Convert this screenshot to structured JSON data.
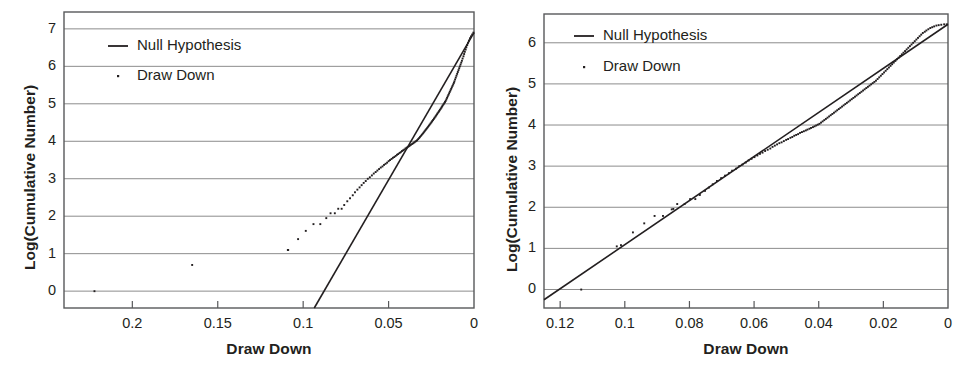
{
  "figure": {
    "panel_count": 2,
    "background": "#ffffff",
    "axis_color": "#58595b",
    "grid_color": "#8c8c8c",
    "series_color": "#231f20",
    "marker_color": "#231f20"
  },
  "chart_data": [
    {
      "id": "left",
      "type": "line",
      "title": "",
      "xlabel": "Draw Down",
      "ylabel": "Log(Cumulative Number)",
      "xlim": [
        0.24,
        0.0
      ],
      "ylim": [
        -0.45,
        7.45
      ],
      "x_reversed": true,
      "grid": true,
      "grid_axis": "y",
      "legend_position": "top-left",
      "xticks": [
        0.2,
        0.15,
        0.1,
        0.05,
        0
      ],
      "xtick_labels": [
        "0.2",
        "0.15",
        "0.1",
        "0.05",
        "0"
      ],
      "yticks": [
        0,
        1,
        2,
        3,
        4,
        5,
        6,
        7
      ],
      "ytick_labels": [
        "0",
        "1",
        "2",
        "3",
        "4",
        "5",
        "6",
        "7"
      ],
      "series": [
        {
          "name": "Null Hypothesis",
          "style": "line",
          "x": [
            0.0935,
            0.0
          ],
          "values": [
            -0.45,
            6.9
          ]
        },
        {
          "name": "Draw Down",
          "style": "scatter",
          "x": [
            0.2222,
            0.165,
            0.109,
            0.1088,
            0.103,
            0.0985,
            0.094,
            0.09,
            0.0865,
            0.084,
            0.0815,
            0.0795,
            0.0775,
            0.076,
            0.0742,
            0.0726,
            0.071,
            0.0697,
            0.0683,
            0.067,
            0.0658,
            0.0646,
            0.0634,
            0.0622,
            0.061,
            0.0598,
            0.0587,
            0.0576,
            0.0566,
            0.0556,
            0.0546,
            0.0536,
            0.0527,
            0.0518,
            0.0509,
            0.05,
            0.0492,
            0.0483,
            0.0475,
            0.0467,
            0.0459,
            0.0451,
            0.0444,
            0.0436,
            0.0429,
            0.0422,
            0.0415,
            0.0408,
            0.0401,
            0.0394,
            0.0388,
            0.0381,
            0.0375,
            0.0369,
            0.0362,
            0.0356,
            0.035,
            0.0344,
            0.0338,
            0.0333,
            0.0327,
            0.0321,
            0.0316,
            0.031,
            0.0305,
            0.0299,
            0.0294,
            0.0289,
            0.0284,
            0.0279,
            0.0274,
            0.0269,
            0.0264,
            0.0259,
            0.0254,
            0.0249,
            0.0245,
            0.024,
            0.0235,
            0.0231,
            0.0226,
            0.0222,
            0.0217,
            0.0213,
            0.0208,
            0.0204,
            0.02,
            0.0195,
            0.0191,
            0.0187,
            0.0183,
            0.0178,
            0.0174,
            0.017,
            0.0166,
            0.0162,
            0.0158,
            0.0154,
            0.015,
            0.0146,
            0.0142,
            0.0138,
            0.0134,
            0.013,
            0.0126,
            0.0122,
            0.0118,
            0.0115,
            0.0111,
            0.0107,
            0.0103,
            0.0099,
            0.0095,
            0.0091,
            0.0087,
            0.0083,
            0.0079,
            0.0075,
            0.0071,
            0.0067,
            0.0062,
            0.0058,
            0.0054,
            0.0049,
            0.0045,
            0.004,
            0.0035,
            0.003,
            0.0024,
            0.0018,
            0.0011,
            0.0004
          ],
          "values": [
            0.0,
            0.7,
            1.1,
            1.1,
            1.39,
            1.61,
            1.79,
            1.79,
            1.95,
            2.08,
            2.08,
            2.2,
            2.2,
            2.3,
            2.4,
            2.48,
            2.56,
            2.64,
            2.71,
            2.77,
            2.83,
            2.89,
            2.94,
            3.0,
            3.04,
            3.09,
            3.14,
            3.18,
            3.22,
            3.26,
            3.3,
            3.33,
            3.37,
            3.4,
            3.43,
            3.47,
            3.5,
            3.53,
            3.56,
            3.58,
            3.61,
            3.64,
            3.66,
            3.69,
            3.71,
            3.74,
            3.76,
            3.78,
            3.81,
            3.83,
            3.85,
            3.87,
            3.89,
            3.91,
            3.93,
            3.95,
            3.97,
            3.99,
            4.01,
            4.03,
            4.06,
            4.09,
            4.12,
            4.15,
            4.18,
            4.21,
            4.24,
            4.27,
            4.3,
            4.33,
            4.36,
            4.39,
            4.42,
            4.45,
            4.48,
            4.51,
            4.54,
            4.57,
            4.6,
            4.63,
            4.66,
            4.69,
            4.72,
            4.75,
            4.78,
            4.81,
            4.84,
            4.87,
            4.9,
            4.93,
            4.96,
            4.99,
            5.02,
            5.05,
            5.08,
            5.12,
            5.16,
            5.2,
            5.24,
            5.28,
            5.32,
            5.36,
            5.4,
            5.44,
            5.48,
            5.52,
            5.56,
            5.6,
            5.65,
            5.7,
            5.75,
            5.8,
            5.85,
            5.9,
            5.95,
            6.0,
            6.05,
            6.1,
            6.15,
            6.21,
            6.27,
            6.33,
            6.39,
            6.45,
            6.51,
            6.57,
            6.63,
            6.69,
            6.75,
            6.8,
            6.85,
            6.9
          ]
        }
      ]
    },
    {
      "id": "right",
      "type": "line",
      "title": "",
      "xlabel": "Draw Down",
      "ylabel": "Log(Cumulative Number)",
      "xlim": [
        0.125,
        0.0
      ],
      "ylim": [
        -0.45,
        6.7
      ],
      "x_reversed": true,
      "grid": true,
      "grid_axis": "y",
      "legend_position": "top-left",
      "xticks": [
        0.12,
        0.1,
        0.08,
        0.06,
        0.04,
        0.02,
        0
      ],
      "xtick_labels": [
        "0.12",
        "0.1",
        "0.08",
        "0.06",
        "0.04",
        "0.02",
        "0"
      ],
      "yticks": [
        0,
        1,
        2,
        3,
        4,
        5,
        6
      ],
      "ytick_labels": [
        "0",
        "1",
        "2",
        "3",
        "4",
        "5",
        "6"
      ],
      "series": [
        {
          "name": "Null Hypothesis",
          "style": "line",
          "x": [
            0.125,
            0.0
          ],
          "values": [
            -0.25,
            6.45
          ]
        },
        {
          "name": "Draw Down",
          "style": "scatter",
          "x": [
            0.1135,
            0.1025,
            0.1012,
            0.0975,
            0.094,
            0.0908,
            0.0882,
            0.0855,
            0.085,
            0.0838,
            0.0815,
            0.0798,
            0.0782,
            0.0768,
            0.0752,
            0.074,
            0.0728,
            0.0715,
            0.0702,
            0.069,
            0.0678,
            0.0668,
            0.0656,
            0.0646,
            0.0636,
            0.0626,
            0.0617,
            0.0608,
            0.0599,
            0.059,
            0.0582,
            0.0574,
            0.0566,
            0.0558,
            0.055,
            0.0543,
            0.0536,
            0.0529,
            0.0522,
            0.0515,
            0.0508,
            0.0501,
            0.0495,
            0.0488,
            0.0482,
            0.0476,
            0.047,
            0.0464,
            0.0458,
            0.0452,
            0.0446,
            0.044,
            0.0435,
            0.0429,
            0.0424,
            0.0418,
            0.0413,
            0.0408,
            0.0403,
            0.0398,
            0.0393,
            0.0388,
            0.0383,
            0.0378,
            0.0373,
            0.0368,
            0.0363,
            0.0358,
            0.0353,
            0.0348,
            0.0343,
            0.0338,
            0.0333,
            0.0328,
            0.0323,
            0.0318,
            0.0313,
            0.0308,
            0.0303,
            0.0298,
            0.0293,
            0.0288,
            0.0283,
            0.0278,
            0.0273,
            0.0268,
            0.0263,
            0.0258,
            0.0253,
            0.0248,
            0.0243,
            0.0238,
            0.0233,
            0.0228,
            0.0223,
            0.0218,
            0.0213,
            0.0208,
            0.0203,
            0.0198,
            0.0193,
            0.0188,
            0.0183,
            0.0178,
            0.0173,
            0.0168,
            0.0163,
            0.0158,
            0.0153,
            0.0148,
            0.0143,
            0.0138,
            0.0133,
            0.0128,
            0.0123,
            0.0118,
            0.0113,
            0.0108,
            0.0103,
            0.0098,
            0.0093,
            0.0088,
            0.0083,
            0.0078,
            0.0072,
            0.0067,
            0.0061,
            0.0055,
            0.0049,
            0.0043,
            0.0036,
            0.0029,
            0.0021,
            0.0012,
            0.0004
          ],
          "values": [
            0.0,
            1.05,
            1.08,
            1.39,
            1.61,
            1.79,
            1.79,
            1.95,
            1.96,
            2.08,
            2.08,
            2.2,
            2.2,
            2.3,
            2.4,
            2.48,
            2.56,
            2.64,
            2.71,
            2.77,
            2.83,
            2.89,
            2.94,
            3.0,
            3.04,
            3.09,
            3.14,
            3.18,
            3.22,
            3.26,
            3.3,
            3.33,
            3.37,
            3.4,
            3.43,
            3.47,
            3.5,
            3.53,
            3.56,
            3.58,
            3.61,
            3.64,
            3.66,
            3.69,
            3.71,
            3.74,
            3.76,
            3.78,
            3.81,
            3.83,
            3.85,
            3.87,
            3.89,
            3.91,
            3.93,
            3.95,
            3.97,
            3.99,
            4.01,
            4.03,
            4.06,
            4.09,
            4.12,
            4.15,
            4.18,
            4.21,
            4.24,
            4.27,
            4.3,
            4.33,
            4.36,
            4.39,
            4.42,
            4.45,
            4.48,
            4.51,
            4.54,
            4.57,
            4.6,
            4.63,
            4.66,
            4.69,
            4.72,
            4.75,
            4.78,
            4.81,
            4.84,
            4.87,
            4.9,
            4.93,
            4.96,
            4.99,
            5.02,
            5.05,
            5.08,
            5.12,
            5.16,
            5.2,
            5.24,
            5.28,
            5.32,
            5.36,
            5.4,
            5.44,
            5.48,
            5.52,
            5.56,
            5.6,
            5.64,
            5.68,
            5.72,
            5.76,
            5.8,
            5.84,
            5.88,
            5.92,
            5.96,
            6.0,
            6.04,
            6.08,
            6.12,
            6.16,
            6.2,
            6.24,
            6.27,
            6.3,
            6.33,
            6.36,
            6.38,
            6.4,
            6.42,
            6.43,
            6.44,
            6.45,
            6.45
          ]
        }
      ]
    }
  ],
  "panels": {
    "left": {
      "legend": {
        "null_hypothesis": "Null Hypothesis",
        "draw_down": "Draw Down"
      },
      "xlabel": "Draw Down",
      "ylabel": "Log(Cumulative Number)",
      "xticks": [
        "0.2",
        "0.15",
        "0.1",
        "0.05",
        "0"
      ],
      "yticks": [
        "7",
        "6",
        "5",
        "4",
        "3",
        "2",
        "1",
        "0"
      ]
    },
    "right": {
      "legend": {
        "null_hypothesis": "Null Hypothesis",
        "draw_down": "Draw Down"
      },
      "xlabel": "Draw Down",
      "ylabel": "Log(Cumulative Number)",
      "xticks": [
        "0.12",
        "0.1",
        "0.08",
        "0.06",
        "0.04",
        "0.02",
        "0"
      ],
      "yticks": [
        "6",
        "5",
        "4",
        "3",
        "2",
        "1",
        "0"
      ]
    }
  }
}
